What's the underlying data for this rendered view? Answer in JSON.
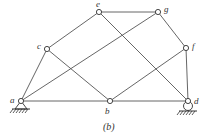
{
  "diagram": {
    "caption": "(b)",
    "colors": {
      "line": "#555555",
      "node_fill": "#ffffff",
      "background": "#ffffff"
    },
    "nodes": [
      {
        "id": "a",
        "label": "a",
        "x": 21,
        "y": 101,
        "lx": 10,
        "ly": 103
      },
      {
        "id": "b",
        "label": "b",
        "x": 110,
        "y": 101,
        "lx": 105,
        "ly": 114
      },
      {
        "id": "c",
        "label": "c",
        "x": 47,
        "y": 49,
        "lx": 37,
        "ly": 49
      },
      {
        "id": "d",
        "label": "d",
        "x": 188,
        "y": 101,
        "lx": 194,
        "ly": 104
      },
      {
        "id": "e",
        "label": "e",
        "x": 99,
        "y": 12,
        "lx": 96,
        "ly": 7
      },
      {
        "id": "f",
        "label": "f",
        "x": 186,
        "y": 48,
        "lx": 192,
        "ly": 49
      },
      {
        "id": "g",
        "label": "g",
        "x": 158,
        "y": 12,
        "lx": 164,
        "ly": 12
      }
    ],
    "edges": [
      [
        "a",
        "c"
      ],
      [
        "c",
        "e"
      ],
      [
        "e",
        "g"
      ],
      [
        "g",
        "f"
      ],
      [
        "f",
        "d"
      ],
      [
        "a",
        "b"
      ],
      [
        "b",
        "d"
      ],
      [
        "c",
        "b"
      ],
      [
        "e",
        "d"
      ],
      [
        "a",
        "g"
      ],
      [
        "b",
        "f"
      ]
    ],
    "supports": [
      {
        "node": "a",
        "type": "pin"
      },
      {
        "node": "d",
        "type": "roller"
      }
    ]
  }
}
